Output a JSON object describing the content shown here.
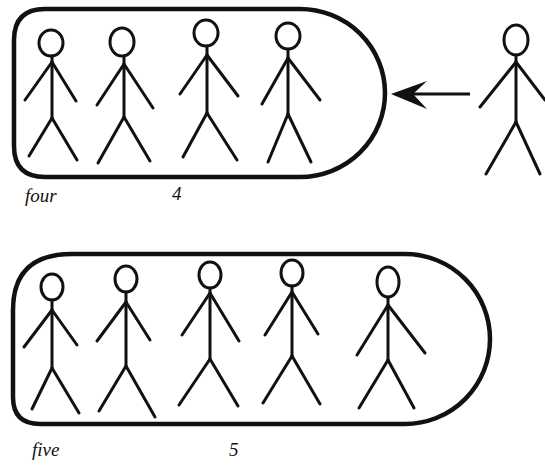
{
  "colors": {
    "ink": "#111111",
    "background": "#ffffff"
  },
  "groups": [
    {
      "word_label": "four",
      "number_label": "4",
      "figure_count": 4,
      "container": {
        "x": 13,
        "y": 8,
        "width": 372,
        "height": 169
      },
      "figures": [
        {
          "head_x": 51,
          "head_y": 43
        },
        {
          "head_x": 122,
          "head_y": 42
        },
        {
          "head_x": 206,
          "head_y": 33
        },
        {
          "head_x": 288,
          "head_y": 36
        }
      ],
      "incoming_figure": {
        "head_x": 516,
        "head_y": 40
      },
      "arrow": {
        "from_x": 470,
        "to_x": 392,
        "y": 94,
        "direction": "left"
      }
    },
    {
      "word_label": "five",
      "number_label": "5",
      "figure_count": 5,
      "container": {
        "x": 12,
        "y": 253,
        "width": 463,
        "height": 171
      },
      "figures": [
        {
          "head_x": 52,
          "head_y": 287
        },
        {
          "head_x": 126,
          "head_y": 279
        },
        {
          "head_x": 210,
          "head_y": 275
        },
        {
          "head_x": 292,
          "head_y": 273
        },
        {
          "head_x": 388,
          "head_y": 282
        }
      ]
    }
  ]
}
